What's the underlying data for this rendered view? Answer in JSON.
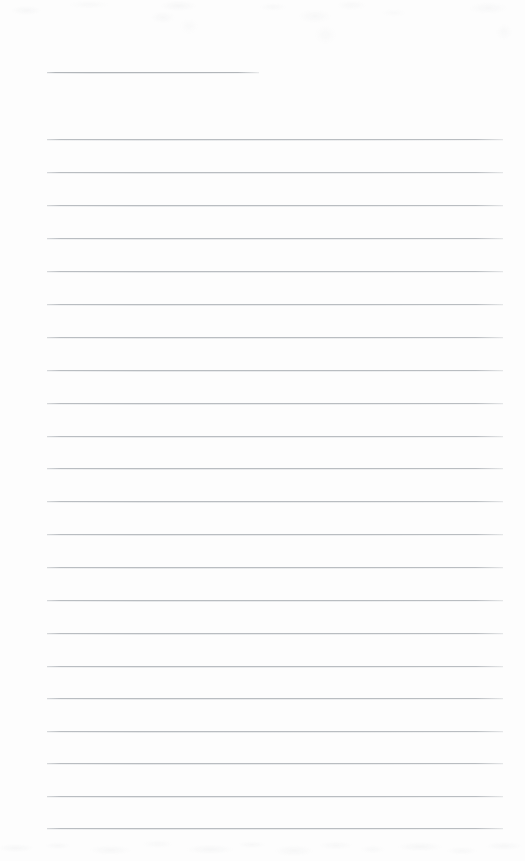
{
  "document": {
    "kind": "lined-writing-paper",
    "title": "",
    "body_text": "",
    "page_width": 525,
    "page_height": 861,
    "background_color": "#fdfdfd",
    "rule_color": "#b9bdc1",
    "rule_thickness_px": 1,
    "rule_spacing_px": 32.7,
    "margin_left_px": 47,
    "margin_right_px": 503,
    "texture_note": "faint scan mottling along top and bottom edges",
    "lines": [
      {
        "id": "line-1",
        "y": 72,
        "x_start": 47,
        "x_end": 259,
        "length_px": 212,
        "variant": "short",
        "content": ""
      },
      {
        "id": "line-2",
        "y": 139,
        "x_start": 47,
        "x_end": 503,
        "length_px": 456,
        "variant": "full",
        "content": ""
      },
      {
        "id": "line-3",
        "y": 172,
        "x_start": 47,
        "x_end": 503,
        "length_px": 456,
        "variant": "full",
        "content": ""
      },
      {
        "id": "line-4",
        "y": 205,
        "x_start": 47,
        "x_end": 503,
        "length_px": 456,
        "variant": "full",
        "content": ""
      },
      {
        "id": "line-5",
        "y": 238,
        "x_start": 47,
        "x_end": 503,
        "length_px": 456,
        "variant": "full",
        "content": ""
      },
      {
        "id": "line-6",
        "y": 271,
        "x_start": 47,
        "x_end": 503,
        "length_px": 456,
        "variant": "full",
        "content": ""
      },
      {
        "id": "line-7",
        "y": 304,
        "x_start": 47,
        "x_end": 503,
        "length_px": 456,
        "variant": "full",
        "content": ""
      },
      {
        "id": "line-8",
        "y": 337,
        "x_start": 47,
        "x_end": 503,
        "length_px": 456,
        "variant": "full",
        "content": ""
      },
      {
        "id": "line-9",
        "y": 370,
        "x_start": 47,
        "x_end": 503,
        "length_px": 456,
        "variant": "full",
        "content": ""
      },
      {
        "id": "line-10",
        "y": 403,
        "x_start": 47,
        "x_end": 503,
        "length_px": 456,
        "variant": "full",
        "content": ""
      },
      {
        "id": "line-11",
        "y": 436,
        "x_start": 47,
        "x_end": 503,
        "length_px": 456,
        "variant": "full",
        "content": ""
      },
      {
        "id": "line-12",
        "y": 468,
        "x_start": 47,
        "x_end": 503,
        "length_px": 456,
        "variant": "full",
        "content": ""
      },
      {
        "id": "line-13",
        "y": 501,
        "x_start": 47,
        "x_end": 503,
        "length_px": 456,
        "variant": "full",
        "content": ""
      },
      {
        "id": "line-14",
        "y": 534,
        "x_start": 47,
        "x_end": 503,
        "length_px": 456,
        "variant": "full",
        "content": ""
      },
      {
        "id": "line-15",
        "y": 567,
        "x_start": 47,
        "x_end": 503,
        "length_px": 456,
        "variant": "full",
        "content": ""
      },
      {
        "id": "line-16",
        "y": 600,
        "x_start": 47,
        "x_end": 503,
        "length_px": 456,
        "variant": "full",
        "content": ""
      },
      {
        "id": "line-17",
        "y": 633,
        "x_start": 47,
        "x_end": 503,
        "length_px": 456,
        "variant": "full",
        "content": ""
      },
      {
        "id": "line-18",
        "y": 666,
        "x_start": 47,
        "x_end": 503,
        "length_px": 456,
        "variant": "full",
        "content": ""
      },
      {
        "id": "line-19",
        "y": 698,
        "x_start": 47,
        "x_end": 503,
        "length_px": 456,
        "variant": "full",
        "content": ""
      },
      {
        "id": "line-20",
        "y": 731,
        "x_start": 47,
        "x_end": 503,
        "length_px": 456,
        "variant": "full",
        "content": ""
      },
      {
        "id": "line-21",
        "y": 763,
        "x_start": 47,
        "x_end": 503,
        "length_px": 456,
        "variant": "full",
        "content": ""
      },
      {
        "id": "line-22",
        "y": 796,
        "x_start": 47,
        "x_end": 503,
        "length_px": 456,
        "variant": "full",
        "content": ""
      },
      {
        "id": "line-23",
        "y": 828,
        "x_start": 47,
        "x_end": 503,
        "length_px": 456,
        "variant": "full",
        "content": ""
      }
    ]
  }
}
